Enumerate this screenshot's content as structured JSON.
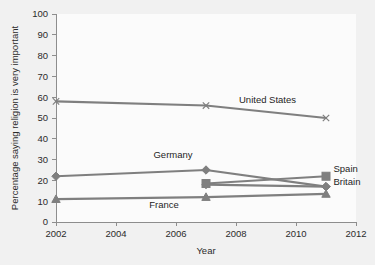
{
  "chart_data": {
    "type": "line",
    "title": "",
    "xlabel": "Year",
    "ylabel": "Percentage saying religion is very important",
    "xlim": [
      2002,
      2012
    ],
    "ylim": [
      0,
      100
    ],
    "xticks": [
      2002,
      2004,
      2006,
      2008,
      2010,
      2012
    ],
    "yticks": [
      0,
      10,
      20,
      30,
      40,
      50,
      60,
      70,
      80,
      90,
      100
    ],
    "grid": false,
    "legend": "inline-labels",
    "line_color": "#7f7f7f",
    "background_color": "#f1f1f1",
    "plot_background_color": "#fbfbfb",
    "series": [
      {
        "name": "United States",
        "marker": "cross",
        "x": [
          2002,
          2007,
          2011
        ],
        "values": [
          58,
          56,
          50
        ],
        "label": "United States",
        "label_x": 2008.1,
        "label_y": 57,
        "label_anchor": "start"
      },
      {
        "name": "Germany",
        "marker": "diamond",
        "x": [
          2002,
          2007,
          2011
        ],
        "values": [
          22,
          25,
          17
        ],
        "label": "Germany",
        "label_x": 2005.9,
        "label_y": 31,
        "label_anchor": "middle"
      },
      {
        "name": "Spain",
        "marker": "square",
        "x": [
          2007,
          2011
        ],
        "values": [
          18.5,
          22
        ],
        "label": "Spain",
        "label_x": 2011.25,
        "label_y": 24,
        "label_anchor": "start"
      },
      {
        "name": "Britain",
        "marker": "diamond",
        "x": [
          2007,
          2011
        ],
        "values": [
          18,
          17
        ],
        "label": "Britain",
        "label_x": 2011.25,
        "label_y": 18,
        "label_anchor": "start"
      },
      {
        "name": "France",
        "marker": "triangle",
        "x": [
          2002,
          2007,
          2011
        ],
        "values": [
          11,
          12,
          13.5
        ],
        "label": "France",
        "label_x": 2005.6,
        "label_y": 6.5,
        "label_anchor": "middle"
      }
    ]
  },
  "axis": {
    "y_title": "Percentage saying religion is very important",
    "x_title": "Year",
    "y_tick_labels": [
      "100",
      "90",
      "80",
      "70",
      "60",
      "50",
      "40",
      "30",
      "20",
      "10",
      "0"
    ],
    "x_tick_labels": [
      "2002",
      "2004",
      "2006",
      "2008",
      "2010",
      "2012"
    ]
  },
  "labels": {
    "united_states": "United States",
    "germany": "Germany",
    "spain": "Spain",
    "britain": "Britain",
    "france": "France"
  }
}
